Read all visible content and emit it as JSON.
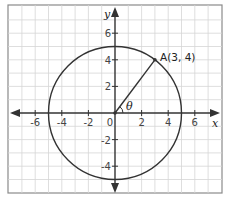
{
  "diagram": {
    "type": "coordinate-plane-circle",
    "axes": {
      "x_label": "x",
      "y_label": "y",
      "range": [
        -7,
        7
      ]
    },
    "x_ticks": [
      "-6",
      "-4",
      "-2",
      "0",
      "2",
      "4",
      "6"
    ],
    "y_ticks": [
      "6",
      "4",
      "2",
      "-2",
      "-4"
    ],
    "circle": {
      "center": [
        0,
        0
      ],
      "radius": 5
    },
    "point": {
      "label": "A(3, 4)",
      "x": 3,
      "y": 4
    },
    "angle_label": "θ",
    "colors": {
      "grid": "#d6d6d6",
      "axis": "#333333",
      "curve": "#333333",
      "frame": "#8a8a8a"
    }
  }
}
